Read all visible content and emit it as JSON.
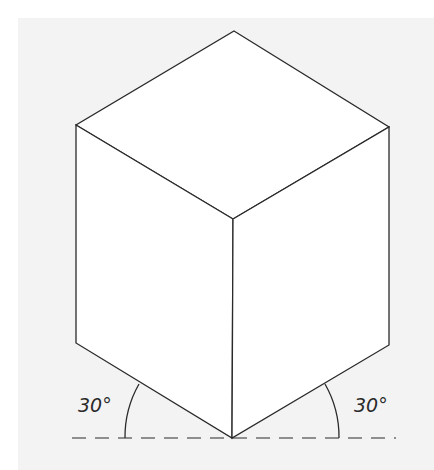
{
  "figure": {
    "type": "isometric-cube",
    "colors": {
      "background_panel": "#f3f3f3",
      "face_fill": "#ffffff",
      "stroke": "#2a2a2a"
    }
  },
  "labels": {
    "left_angle": "30°",
    "right_angle": "30°"
  }
}
